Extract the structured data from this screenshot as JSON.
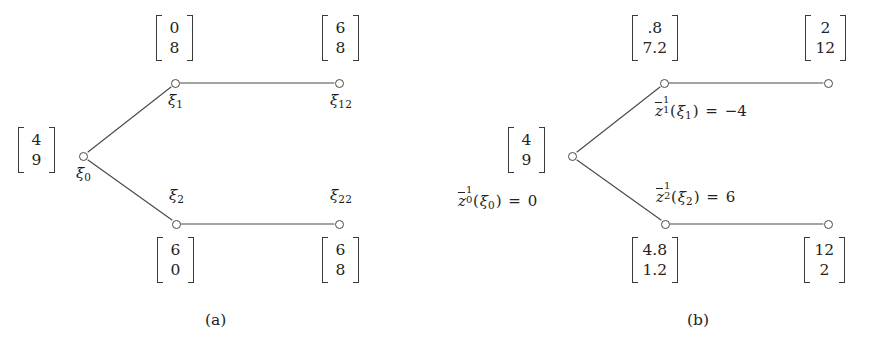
{
  "figure": {
    "background_color": "#ffffff",
    "stroke_color": "#4a4a4a",
    "text_color": "#232323"
  },
  "panels": [
    {
      "id": "panel-a",
      "caption": "(a)",
      "nodes": [
        {
          "id": "xi0",
          "label_base": "ξ",
          "label_sub": "0",
          "x": 83,
          "y": 156,
          "label_x": 76,
          "label_y": 166,
          "vector": {
            "top": "4",
            "bottom": "9"
          },
          "vector_x": 18,
          "vector_y": 127
        },
        {
          "id": "xi1",
          "label_base": "ξ",
          "label_sub": "1",
          "x": 175,
          "y": 83,
          "label_x": 168,
          "label_y": 93,
          "vector": {
            "top": "0",
            "bottom": "8"
          },
          "vector_x": 156,
          "vector_y": 15
        },
        {
          "id": "xi12",
          "label_base": "ξ",
          "label_sub": "12",
          "x": 339,
          "y": 83,
          "label_x": 330,
          "label_y": 93,
          "vector": {
            "top": "6",
            "bottom": "8"
          },
          "vector_x": 322,
          "vector_y": 15
        },
        {
          "id": "xi2",
          "label_base": "ξ",
          "label_sub": "2",
          "x": 176,
          "y": 224,
          "label_x": 169,
          "label_y": 188,
          "vector": {
            "top": "6",
            "bottom": "0"
          },
          "vector_x": 157,
          "vector_y": 237
        },
        {
          "id": "xi22",
          "label_base": "ξ",
          "label_sub": "22",
          "x": 339,
          "y": 224,
          "label_x": 330,
          "label_y": 188,
          "vector": {
            "top": "6",
            "bottom": "8"
          },
          "vector_x": 322,
          "vector_y": 237
        }
      ],
      "edges": [
        {
          "from": "xi0",
          "to": "xi1"
        },
        {
          "from": "xi0",
          "to": "xi2"
        },
        {
          "from": "xi1",
          "to": "xi12"
        },
        {
          "from": "xi2",
          "to": "xi22"
        }
      ],
      "caption_x": 205,
      "caption_y": 313
    },
    {
      "id": "panel-b",
      "caption": "(b)",
      "nodes": [
        {
          "id": "b-xi0",
          "x": 572,
          "y": 156,
          "vector": {
            "top": "4",
            "bottom": "9"
          },
          "vector_x": 508,
          "vector_y": 127
        },
        {
          "id": "b-xi1",
          "x": 664,
          "y": 83,
          "vector": {
            "top": ".8",
            "bottom": "7.2"
          },
          "vector_x": 632,
          "vector_y": 15
        },
        {
          "id": "b-xi12",
          "x": 828,
          "y": 83,
          "vector": {
            "top": "2",
            "bottom": "12"
          },
          "vector_x": 805,
          "vector_y": 15
        },
        {
          "id": "b-xi2",
          "x": 665,
          "y": 224,
          "vector": {
            "top": "4.8",
            "bottom": "1.2"
          },
          "vector_x": 632,
          "vector_y": 237
        },
        {
          "id": "b-xi22",
          "x": 828,
          "y": 224,
          "vector": {
            "top": "12",
            "bottom": "2"
          },
          "vector_x": 804,
          "vector_y": 237
        }
      ],
      "edges": [
        {
          "from": "b-xi0",
          "to": "b-xi1"
        },
        {
          "from": "b-xi0",
          "to": "b-xi2"
        },
        {
          "from": "b-xi1",
          "to": "b-xi12"
        },
        {
          "from": "b-xi2",
          "to": "b-xi22"
        }
      ],
      "value_labels": [
        {
          "id": "zbar-0",
          "z": "z",
          "sup": "1",
          "sub": "0",
          "arg_base": "ξ",
          "arg_sub": "0",
          "eq": "=",
          "value": "0",
          "x": 458,
          "y": 191
        },
        {
          "id": "zbar-1",
          "z": "z",
          "sup": "1",
          "sub": "1",
          "arg_base": "ξ",
          "arg_sub": "1",
          "eq": "=",
          "value": "−4",
          "x": 655,
          "y": 101
        },
        {
          "id": "zbar-2",
          "z": "z",
          "sup": "1",
          "sub": "2",
          "arg_base": "ξ",
          "arg_sub": "2",
          "eq": "=",
          "value": "6",
          "x": 656,
          "y": 187
        }
      ],
      "caption_x": 687,
      "caption_y": 313
    }
  ]
}
